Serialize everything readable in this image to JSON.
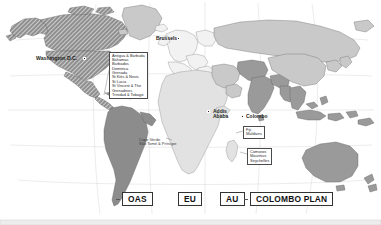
{
  "map": {
    "title": "World map of international organization membership",
    "background_color": "#ffffff",
    "graticule_color": "#bdbdbd",
    "border_color": "#6e6e6e",
    "regions": {
      "oas_hatched": {
        "name": "OAS",
        "fill": "#8f8f8f",
        "hatch": true,
        "hatch_color": "#ffffff"
      },
      "oas_solid": {
        "name": "OAS",
        "fill": "#8c8c8c",
        "hatch": false
      },
      "eu": {
        "name": "EU",
        "fill": "#f2f2f2",
        "hatch": false
      },
      "au": {
        "name": "AU",
        "fill": "#e2e2e2",
        "hatch": false
      },
      "colombo": {
        "name": "COLOMBO PLAN",
        "fill": "#9a9a9a",
        "hatch": false
      },
      "other": {
        "name": "Non-member",
        "fill": "#c9c9c9",
        "hatch": false
      }
    }
  },
  "cities": [
    {
      "id": "washington",
      "label": "Washington D.C.",
      "marker": "capital-marker"
    },
    {
      "id": "brussels",
      "label": "Brussels",
      "marker": "capital-marker"
    },
    {
      "id": "addis",
      "label_line1": "Addis",
      "label_line2": "Ababa",
      "marker": "capital-marker"
    },
    {
      "id": "colombo",
      "label": "Colombo",
      "marker": "capital-marker"
    }
  ],
  "callouts": {
    "caribbean": {
      "name": "caribbean-oas-states",
      "items": [
        "Antigua & Barbuda",
        "Bahamas",
        "Barbados",
        "Dominica",
        "Grenada",
        "St Kitts & Nevis",
        "St Lucia",
        "St Vincent & The",
        "  Grenadines",
        "Trinidad & Tobago"
      ]
    },
    "atlantic_islands": {
      "name": "atlantic-au-islands",
      "items": [
        "Cape Verde",
        "São Tomé & Príncipe"
      ]
    },
    "colombo_islands": {
      "name": "colombo-plan-islands",
      "items": [
        "Fiji",
        "Maldives"
      ]
    },
    "indian_ocean_islands": {
      "name": "indian-ocean-au-islands",
      "items": [
        "Comoros",
        "Mauritius",
        "Seychelles"
      ]
    }
  },
  "legend": {
    "items": [
      {
        "id": "oas",
        "label": "OAS",
        "leader": true
      },
      {
        "id": "eu",
        "label": "EU",
        "leader": false
      },
      {
        "id": "au",
        "label": "AU",
        "leader": false
      },
      {
        "id": "colombo",
        "label": "COLOMBO PLAN",
        "leader": true
      }
    ]
  }
}
